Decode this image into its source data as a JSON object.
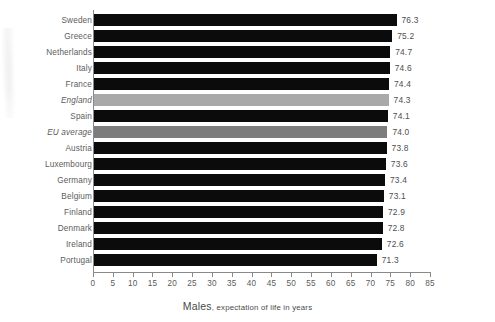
{
  "chart_data": {
    "type": "bar",
    "orientation": "horizontal",
    "title": "",
    "subtitle": "",
    "xlabel_strong": "Males",
    "xlabel_rest": ", expectation of life in years",
    "xlabel": "Males, expectation of life in years",
    "ylabel": "",
    "xlim": [
      0,
      85
    ],
    "xticks": [
      0,
      5,
      10,
      15,
      20,
      25,
      30,
      35,
      40,
      45,
      50,
      55,
      60,
      65,
      70,
      75,
      80,
      85
    ],
    "xtick_labels": [
      "0",
      "5",
      "10",
      "15",
      "20",
      "25",
      "30",
      "35",
      "40",
      "45",
      "50",
      "55",
      "60",
      "65",
      "70",
      "75",
      "80",
      "85"
    ],
    "grid": false,
    "legend": "none",
    "value_label_format": "one-decimal",
    "colors": {
      "bar_default": "#0b0b0b",
      "bar_highlight_england": "#a9a9a9",
      "bar_highlight_eu_average": "#7d7d7d",
      "axis": "#8a8a8a",
      "text": "#5b5b5b",
      "background": "#ffffff"
    },
    "categories": [
      "Sweden",
      "Greece",
      "Netherlands",
      "Italy",
      "France",
      "England",
      "Spain",
      "EU average",
      "Austria",
      "Luxembourg",
      "Germany",
      "Belgium",
      "Finland",
      "Denmark",
      "Ireland",
      "Portugal"
    ],
    "values": [
      76.3,
      75.2,
      74.7,
      74.6,
      74.4,
      74.3,
      74.1,
      74.0,
      73.8,
      73.6,
      73.4,
      73.1,
      72.9,
      72.8,
      72.6,
      71.3
    ],
    "rows": [
      {
        "label": "Sweden",
        "value": 76.3,
        "value_label": "76.3",
        "style": "default",
        "italic": false
      },
      {
        "label": "Greece",
        "value": 75.2,
        "value_label": "75.2",
        "style": "default",
        "italic": false
      },
      {
        "label": "Netherlands",
        "value": 74.7,
        "value_label": "74.7",
        "style": "default",
        "italic": false
      },
      {
        "label": "Italy",
        "value": 74.6,
        "value_label": "74.6",
        "style": "default",
        "italic": false
      },
      {
        "label": "France",
        "value": 74.4,
        "value_label": "74.4",
        "style": "default",
        "italic": false
      },
      {
        "label": "England",
        "value": 74.3,
        "value_label": "74.3",
        "style": "light",
        "italic": true
      },
      {
        "label": "Spain",
        "value": 74.1,
        "value_label": "74.1",
        "style": "default",
        "italic": false
      },
      {
        "label": "EU average",
        "value": 74.0,
        "value_label": "74.0",
        "style": "mid",
        "italic": true
      },
      {
        "label": "Austria",
        "value": 73.8,
        "value_label": "73.8",
        "style": "default",
        "italic": false
      },
      {
        "label": "Luxembourg",
        "value": 73.6,
        "value_label": "73.6",
        "style": "default",
        "italic": false
      },
      {
        "label": "Germany",
        "value": 73.4,
        "value_label": "73.4",
        "style": "default",
        "italic": false
      },
      {
        "label": "Belgium",
        "value": 73.1,
        "value_label": "73.1",
        "style": "default",
        "italic": false
      },
      {
        "label": "Finland",
        "value": 72.9,
        "value_label": "72.9",
        "style": "default",
        "italic": false
      },
      {
        "label": "Denmark",
        "value": 72.8,
        "value_label": "72.8",
        "style": "default",
        "italic": false
      },
      {
        "label": "Ireland",
        "value": 72.6,
        "value_label": "72.6",
        "style": "default",
        "italic": false
      },
      {
        "label": "Portugal",
        "value": 71.3,
        "value_label": "71.3",
        "style": "default",
        "italic": false
      }
    ]
  }
}
